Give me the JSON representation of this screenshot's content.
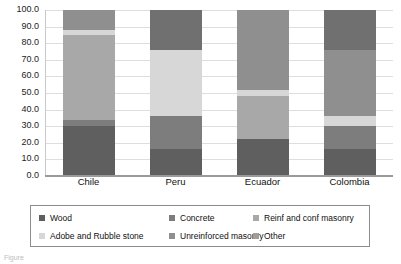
{
  "chart_data": {
    "type": "bar",
    "stacked": true,
    "stack_mode": "percent",
    "title": "",
    "subtitle": "",
    "xlabel": "",
    "ylabel": "",
    "categories": [
      "Chile",
      "Peru",
      "Ecuador",
      "Colombia"
    ],
    "ylim": [
      0.0,
      100.0
    ],
    "ytick_labels": [
      "100.0",
      "90.0",
      "80.0",
      "70.0",
      "60.0",
      "50.0",
      "40.0",
      "30.0",
      "20.0",
      "10.0",
      "0.0"
    ],
    "ytick_values": [
      100.0,
      90.0,
      80.0,
      70.0,
      60.0,
      50.0,
      40.0,
      30.0,
      20.0,
      10.0,
      0.0
    ],
    "grid": true,
    "grid_axis": "y",
    "legend_position": "bottom",
    "legend_columns": 3,
    "series": [
      {
        "name": "Wood",
        "color": "#5f5f5f",
        "values": [
          30.0,
          16.0,
          22.0,
          16.0
        ]
      },
      {
        "name": "Concrete",
        "color": "#7d7d7d",
        "values": [
          4.0,
          20.0,
          0.0,
          14.0
        ]
      },
      {
        "name": "Reinf and conf masonry",
        "color": "#a8a8a8",
        "values": [
          51.0,
          0.0,
          26.0,
          0.0
        ]
      },
      {
        "name": "Adobe and Rubble stone",
        "color": "#d7d7d7",
        "values": [
          3.0,
          40.0,
          4.0,
          6.0
        ]
      },
      {
        "name": "Unreinforced masonry",
        "color": "#8f8f8f",
        "values": [
          12.0,
          0.0,
          48.0,
          40.0
        ]
      },
      {
        "name": "Other",
        "color": "#707070",
        "values": [
          0.0,
          24.0,
          0.0,
          24.0
        ]
      }
    ]
  },
  "legend": {
    "items": [
      {
        "label": "Wood",
        "color": "#5f5f5f"
      },
      {
        "label": "Concrete",
        "color": "#7d7d7d"
      },
      {
        "label": "Reinf and conf masonry",
        "color": "#a8a8a8"
      },
      {
        "label": "Adobe and Rubble stone",
        "color": "#d7d7d7"
      },
      {
        "label": "Unreinforced masonry",
        "color": "#8f8f8f"
      },
      {
        "label": "Other",
        "color": "#9e9e9e"
      }
    ]
  },
  "caption": {
    "text": "Figure"
  }
}
